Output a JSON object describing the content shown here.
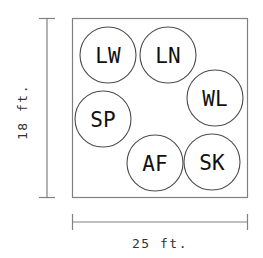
{
  "diagram": {
    "type": "room-seating-layout",
    "room": {
      "shape": "rectangle",
      "width_label": "25 ft.",
      "height_label": "18 ft.",
      "outline_color": "#808080",
      "fill_color": "#ffffff"
    },
    "dimensions": {
      "horizontal": {
        "label": "25 ft.",
        "value": 25,
        "unit": "ft.",
        "position": "bottom"
      },
      "vertical": {
        "label": "18 ft.",
        "value": 18,
        "unit": "ft.",
        "position": "left",
        "orientation": "rotated-90"
      }
    },
    "tables": [
      {
        "id": "lw",
        "label": "LW",
        "cx": 108,
        "cy": 55,
        "r": 28
      },
      {
        "id": "ln",
        "label": "LN",
        "cx": 168,
        "cy": 55,
        "r": 28
      },
      {
        "id": "wl",
        "label": "WL",
        "cx": 215,
        "cy": 98,
        "r": 28
      },
      {
        "id": "sp",
        "label": "SP",
        "cx": 103,
        "cy": 119,
        "r": 28
      },
      {
        "id": "af",
        "label": "AF",
        "cx": 155,
        "cy": 163,
        "r": 28
      },
      {
        "id": "sk",
        "label": "SK",
        "cx": 212,
        "cy": 162,
        "r": 28
      }
    ],
    "colors": {
      "circle_stroke": "#4d4d4d",
      "rect_stroke": "#808080",
      "label_text": "#111111",
      "dimension_text": "#333333",
      "background": "#ffffff"
    }
  }
}
